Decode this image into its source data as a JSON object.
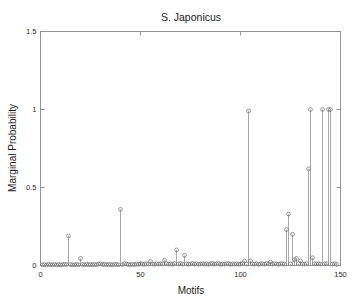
{
  "chart_data": {
    "type": "line",
    "plot_style": "stem",
    "title": "S. Japonicus",
    "xlabel": "Motifs",
    "ylabel": "Marginal Probability",
    "xlim": [
      0,
      150
    ],
    "ylim": [
      0,
      1.5
    ],
    "xticks": [
      0,
      50,
      100,
      150
    ],
    "xticklabels": [
      "0",
      "50",
      "100",
      "150"
    ],
    "yticks": [
      0,
      0.5,
      1,
      1.5
    ],
    "yticklabels": [
      "0",
      "0.5",
      "1",
      "1.5"
    ],
    "grid": false,
    "legend": null,
    "marker": "open-circle",
    "series_name": "marginal probability",
    "x": [
      1,
      2,
      3,
      4,
      5,
      6,
      7,
      8,
      9,
      10,
      11,
      12,
      13,
      14,
      15,
      16,
      17,
      18,
      19,
      20,
      21,
      22,
      23,
      24,
      25,
      26,
      27,
      28,
      29,
      30,
      31,
      32,
      33,
      34,
      35,
      36,
      37,
      38,
      39,
      40,
      41,
      42,
      43,
      44,
      45,
      46,
      47,
      48,
      49,
      50,
      51,
      52,
      53,
      54,
      55,
      56,
      57,
      58,
      59,
      60,
      61,
      62,
      63,
      64,
      65,
      66,
      67,
      68,
      69,
      70,
      71,
      72,
      73,
      74,
      75,
      76,
      77,
      78,
      79,
      80,
      81,
      82,
      83,
      84,
      85,
      86,
      87,
      88,
      89,
      90,
      91,
      92,
      93,
      94,
      95,
      96,
      97,
      98,
      99,
      100,
      101,
      102,
      103,
      104,
      105,
      106,
      107,
      108,
      109,
      110,
      111,
      112,
      113,
      114,
      115,
      116,
      117,
      118,
      119,
      120,
      121,
      122,
      123,
      124,
      125,
      126,
      127,
      128,
      129,
      130,
      131,
      132,
      133,
      134,
      135,
      136,
      137,
      138,
      139,
      140,
      141,
      142,
      143,
      144,
      145,
      146,
      147,
      148
    ],
    "values": [
      0.004,
      0.006,
      0.003,
      0.008,
      0.005,
      0.004,
      0.007,
      0.003,
      0.006,
      0.004,
      0.005,
      0.008,
      0.006,
      0.19,
      0.006,
      0.004,
      0.005,
      0.007,
      0.004,
      0.045,
      0.006,
      0.004,
      0.008,
      0.005,
      0.006,
      0.004,
      0.007,
      0.005,
      0.009,
      0.012,
      0.006,
      0.008,
      0.005,
      0.007,
      0.006,
      0.004,
      0.008,
      0.006,
      0.005,
      0.36,
      0.006,
      0.012,
      0.009,
      0.007,
      0.005,
      0.008,
      0.006,
      0.01,
      0.007,
      0.012,
      0.009,
      0.008,
      0.011,
      0.009,
      0.026,
      0.01,
      0.008,
      0.012,
      0.009,
      0.011,
      0.01,
      0.034,
      0.012,
      0.009,
      0.011,
      0.008,
      0.013,
      0.1,
      0.01,
      0.012,
      0.009,
      0.065,
      0.011,
      0.008,
      0.01,
      0.012,
      0.009,
      0.011,
      0.008,
      0.01,
      0.012,
      0.009,
      0.011,
      0.008,
      0.01,
      0.013,
      0.009,
      0.011,
      0.012,
      0.008,
      0.01,
      0.009,
      0.012,
      0.011,
      0.008,
      0.01,
      0.009,
      0.011,
      0.008,
      0.01,
      0.012,
      0.028,
      0.01,
      0.99,
      0.03,
      0.011,
      0.009,
      0.012,
      0.008,
      0.01,
      0.011,
      0.009,
      0.013,
      0.01,
      0.022,
      0.009,
      0.012,
      0.01,
      0.008,
      0.011,
      0.012,
      0.009,
      0.23,
      0.33,
      0.01,
      0.2,
      0.038,
      0.045,
      0.012,
      0.03,
      0.01,
      0.009,
      0.012,
      0.62,
      1.0,
      0.05,
      0.011,
      0.01,
      0.012,
      0.009,
      1.0,
      0.01,
      0.012,
      1.0,
      1.0,
      0.009,
      0.011,
      0.008
    ],
    "notable_peaks": [
      {
        "x": 14,
        "y": 0.19
      },
      {
        "x": 40,
        "y": 0.36
      },
      {
        "x": 68,
        "y": 0.1
      },
      {
        "x": 72,
        "y": 0.065
      },
      {
        "x": 104,
        "y": 0.99
      },
      {
        "x": 123,
        "y": 0.23
      },
      {
        "x": 124,
        "y": 0.33
      },
      {
        "x": 126,
        "y": 0.2
      },
      {
        "x": 134,
        "y": 0.62
      },
      {
        "x": 135,
        "y": 1.0
      },
      {
        "x": 141,
        "y": 1.0
      },
      {
        "x": 144,
        "y": 1.0
      },
      {
        "x": 145,
        "y": 1.0
      }
    ]
  },
  "colors": {
    "background": "#ffffff",
    "axis": "#8c8c8c",
    "stem": "#7a7a7a",
    "marker": "#6e6e6e",
    "text": "#1a1a1a"
  }
}
